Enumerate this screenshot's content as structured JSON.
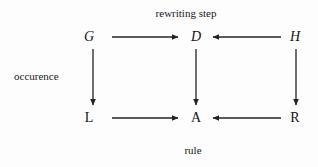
{
  "diagram": {
    "title_top": "rewriting step",
    "label_left": "occurence",
    "label_bottom": "rule",
    "nodes": [
      {
        "id": "G",
        "label": "G",
        "style": "italic",
        "x": 89,
        "y": 37
      },
      {
        "id": "D",
        "label": "D",
        "style": "italic",
        "x": 196,
        "y": 37
      },
      {
        "id": "H",
        "label": "H",
        "style": "italic",
        "x": 295,
        "y": 37
      },
      {
        "id": "L",
        "label": "L",
        "style": "upright",
        "x": 89,
        "y": 118
      },
      {
        "id": "A",
        "label": "A",
        "style": "upright",
        "x": 196,
        "y": 118
      },
      {
        "id": "R",
        "label": "R",
        "style": "upright",
        "x": 295,
        "y": 118
      }
    ],
    "edges": [
      {
        "from": "G",
        "to": "D",
        "direction": "right",
        "x1": 112,
        "y1": 37,
        "x2": 180,
        "y2": 37
      },
      {
        "from": "H",
        "to": "D",
        "direction": "left",
        "x1": 281,
        "y1": 37,
        "x2": 211,
        "y2": 37
      },
      {
        "from": "G",
        "to": "L",
        "direction": "down",
        "x1": 93,
        "y1": 49,
        "x2": 93,
        "y2": 107
      },
      {
        "from": "D",
        "to": "A",
        "direction": "down",
        "x1": 196,
        "y1": 49,
        "x2": 196,
        "y2": 107
      },
      {
        "from": "H",
        "to": "R",
        "direction": "down",
        "x1": 296,
        "y1": 49,
        "x2": 296,
        "y2": 107
      },
      {
        "from": "L",
        "to": "A",
        "direction": "right",
        "x1": 112,
        "y1": 118,
        "x2": 180,
        "y2": 118
      },
      {
        "from": "R",
        "to": "A",
        "direction": "left",
        "x1": 281,
        "y1": 118,
        "x2": 211,
        "y2": 118
      }
    ],
    "captions": [
      {
        "id": "top",
        "text": "rewriting step",
        "x": 186,
        "y": 8,
        "align": "center"
      },
      {
        "id": "left",
        "text": "occurence",
        "x": 14,
        "y": 71,
        "align": "left"
      },
      {
        "id": "bottom",
        "text": "rule",
        "x": 193,
        "y": 145,
        "align": "center"
      }
    ],
    "colors": {
      "background": "#fdfdfd",
      "stroke": "#232323",
      "text": "#141414"
    }
  }
}
